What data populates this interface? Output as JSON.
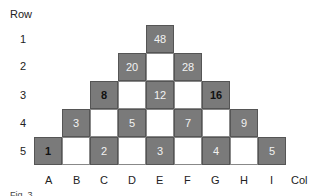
{
  "axes": {
    "row_title": "Row",
    "col_title": "Col",
    "rows": [
      "1",
      "2",
      "3",
      "4",
      "5"
    ],
    "cols": [
      "A",
      "B",
      "C",
      "D",
      "E",
      "F",
      "G",
      "H",
      "I"
    ]
  },
  "cells": [
    {
      "row": 1,
      "col": "E",
      "value": "48",
      "shade": "gray",
      "bold": false
    },
    {
      "row": 2,
      "col": "D",
      "value": "20",
      "shade": "gray",
      "bold": false
    },
    {
      "row": 2,
      "col": "E",
      "value": "",
      "shade": "white",
      "bold": false
    },
    {
      "row": 2,
      "col": "F",
      "value": "28",
      "shade": "gray",
      "bold": false
    },
    {
      "row": 3,
      "col": "C",
      "value": "8",
      "shade": "gray",
      "bold": true
    },
    {
      "row": 3,
      "col": "D",
      "value": "",
      "shade": "white",
      "bold": false
    },
    {
      "row": 3,
      "col": "E",
      "value": "12",
      "shade": "gray",
      "bold": false
    },
    {
      "row": 3,
      "col": "F",
      "value": "",
      "shade": "white",
      "bold": false
    },
    {
      "row": 3,
      "col": "G",
      "value": "16",
      "shade": "gray",
      "bold": true
    },
    {
      "row": 4,
      "col": "B",
      "value": "3",
      "shade": "gray",
      "bold": false
    },
    {
      "row": 4,
      "col": "C",
      "value": "",
      "shade": "white",
      "bold": false
    },
    {
      "row": 4,
      "col": "D",
      "value": "5",
      "shade": "gray",
      "bold": false
    },
    {
      "row": 4,
      "col": "E",
      "value": "",
      "shade": "white",
      "bold": false
    },
    {
      "row": 4,
      "col": "F",
      "value": "7",
      "shade": "gray",
      "bold": false
    },
    {
      "row": 4,
      "col": "G",
      "value": "",
      "shade": "white",
      "bold": false
    },
    {
      "row": 4,
      "col": "H",
      "value": "9",
      "shade": "gray",
      "bold": false
    },
    {
      "row": 5,
      "col": "A",
      "value": "1",
      "shade": "gray",
      "bold": true
    },
    {
      "row": 5,
      "col": "B",
      "value": "",
      "shade": "white",
      "bold": false
    },
    {
      "row": 5,
      "col": "C",
      "value": "2",
      "shade": "gray",
      "bold": false
    },
    {
      "row": 5,
      "col": "D",
      "value": "",
      "shade": "white",
      "bold": false
    },
    {
      "row": 5,
      "col": "E",
      "value": "3",
      "shade": "gray",
      "bold": false
    },
    {
      "row": 5,
      "col": "F",
      "value": "",
      "shade": "white",
      "bold": false
    },
    {
      "row": 5,
      "col": "G",
      "value": "4",
      "shade": "gray",
      "bold": false
    },
    {
      "row": 5,
      "col": "H",
      "value": "",
      "shade": "white",
      "bold": false
    },
    {
      "row": 5,
      "col": "I",
      "value": "5",
      "shade": "gray",
      "bold": false
    }
  ],
  "caption": "Fig. 3",
  "colors": {
    "gray_cell": "#7a7a7a",
    "white_cell": "#ffffff"
  }
}
